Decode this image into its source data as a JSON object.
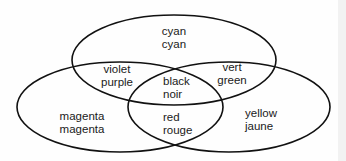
{
  "diagram": {
    "type": "venn",
    "sets": [
      {
        "id": "cyan",
        "line1": "cyan",
        "line2": "cyan"
      },
      {
        "id": "magenta",
        "line1": "magenta",
        "line2": "magenta"
      },
      {
        "id": "yellow",
        "line1": "yellow",
        "line2": "jaune"
      }
    ],
    "regions": {
      "cyan": {
        "line1": "cyan",
        "line2": "cyan"
      },
      "cyan_magenta": {
        "line1": "violet",
        "line2": "purple"
      },
      "cyan_yellow": {
        "line1": "vert",
        "line2": "green"
      },
      "all": {
        "line1": "black",
        "line2": "noir"
      },
      "magenta": {
        "line1": "magenta",
        "line2": "magenta"
      },
      "magenta_yellow": {
        "line1": "red",
        "line2": "rouge"
      },
      "yellow": {
        "line1": "yellow",
        "line2": "jaune"
      }
    },
    "colors": {
      "stroke": "#111111",
      "background": "#fefefe",
      "text": "#1a1a1a"
    }
  }
}
